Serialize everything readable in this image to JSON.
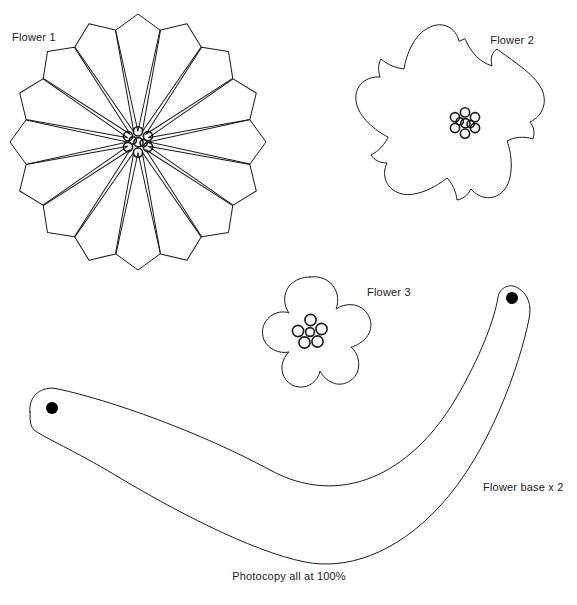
{
  "page": {
    "width": 577,
    "height": 605,
    "background_color": "#ffffff",
    "ink_color": "#1a1a1a",
    "stroke_width": 1
  },
  "labels": {
    "flower1": "Flower 1",
    "flower2": "Flower 2",
    "flower3": "Flower 3",
    "flower_base": "Flower base x 2",
    "footer": "Photocopy all at 100%"
  },
  "templates": [
    {
      "id": "flower-1",
      "label": "Flower 1",
      "shape": "multi-petal-rosette",
      "petal_count": 16,
      "center": {
        "x": 138,
        "y": 142
      },
      "outer_radius": 128,
      "stamen_circles": 9,
      "stamen_radius": 4.6
    },
    {
      "id": "flower-2",
      "label": "Flower 2",
      "shape": "five-petal-notched-blossom",
      "petal_count": 5,
      "center": {
        "x": 465,
        "y": 123
      },
      "outer_radius": 84,
      "stamen_circles": 9,
      "stamen_radius": 4.4
    },
    {
      "id": "flower-3",
      "label": "Flower 3",
      "shape": "five-petal-rounded-blossom",
      "petal_count": 5,
      "center": {
        "x": 310,
        "y": 332
      },
      "outer_radius": 60,
      "stamen_circles": 6,
      "stamen_radius": 5.2
    },
    {
      "id": "flower-base",
      "label": "Flower base x 2",
      "shape": "crescent-strip",
      "quantity": 2,
      "punch_holes": [
        {
          "x": 52,
          "y": 408,
          "r": 6
        },
        {
          "x": 512,
          "y": 298,
          "r": 6
        }
      ]
    }
  ]
}
